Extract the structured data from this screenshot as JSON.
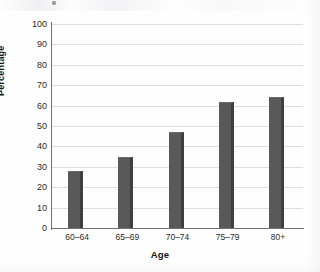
{
  "chart_data": {
    "type": "bar",
    "title": "",
    "subtitle": "",
    "categories": [
      "60–64",
      "65–69",
      "70–74",
      "75–79",
      "80+"
    ],
    "values": [
      28,
      35,
      47,
      62,
      64
    ],
    "series": [
      {
        "name": "Percentage",
        "values": [
          28,
          35,
          47,
          62,
          64
        ]
      }
    ],
    "xlabel": "Age",
    "ylabel": "Percentage",
    "ylim": [
      0,
      100
    ],
    "yticks": [
      0,
      10,
      20,
      30,
      40,
      50,
      60,
      70,
      80,
      90,
      100
    ],
    "ytick_labels": [
      "0",
      "10",
      "20",
      "30",
      "40",
      "50",
      "60",
      "70",
      "80",
      "90",
      "100"
    ],
    "grid": true,
    "grid_axis": "y",
    "legend": false,
    "legend_position": "none",
    "bar_color": "#595959",
    "bar_edge_color": "#3f3f3f",
    "gridline_color": "#dedede",
    "axis_color": "#6f6f6f",
    "background_color": "#ffffff"
  }
}
